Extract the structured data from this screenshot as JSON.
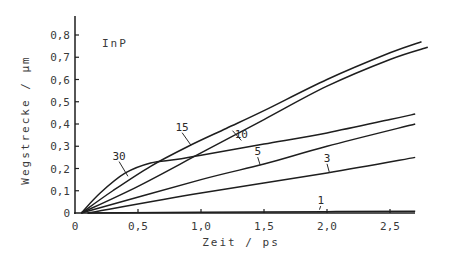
{
  "chart_data": {
    "type": "line",
    "title": "",
    "annotation": "InP",
    "xlabel": "Zeit / ps",
    "ylabel": "Wegstrecke / µm",
    "xlim": [
      0,
      2.7
    ],
    "ylim": [
      0,
      0.85
    ],
    "grid": false,
    "legend": "inline curve labels",
    "x_ticks": [
      {
        "value": 0,
        "label": "0"
      },
      {
        "value": 0.5,
        "label": "0,5"
      },
      {
        "value": 1.0,
        "label": "1,0"
      },
      {
        "value": 1.5,
        "label": "1,5"
      },
      {
        "value": 2.0,
        "label": "2,0"
      },
      {
        "value": 2.5,
        "label": "2,5"
      }
    ],
    "y_ticks": [
      {
        "value": 0,
        "label": "0"
      },
      {
        "value": 0.1,
        "label": "0,1"
      },
      {
        "value": 0.2,
        "label": "0,2"
      },
      {
        "value": 0.3,
        "label": "0,3"
      },
      {
        "value": 0.4,
        "label": "0,4"
      },
      {
        "value": 0.5,
        "label": "0,5"
      },
      {
        "value": 0.6,
        "label": "0,6"
      },
      {
        "value": 0.7,
        "label": "0,7"
      },
      {
        "value": 0.8,
        "label": "0,8"
      }
    ],
    "series": [
      {
        "name": "30",
        "label_pos": [
          0.35,
          0.24
        ],
        "leader_to": [
          0.42,
          0.165
        ],
        "points": [
          [
            0.05,
            0
          ],
          [
            0.2,
            0.09
          ],
          [
            0.4,
            0.18
          ],
          [
            0.6,
            0.225
          ],
          [
            0.8,
            0.24
          ],
          [
            1.0,
            0.26
          ],
          [
            1.5,
            0.31
          ],
          [
            2.0,
            0.36
          ],
          [
            2.5,
            0.42
          ],
          [
            2.7,
            0.445
          ]
        ]
      },
      {
        "name": "15",
        "label_pos": [
          0.85,
          0.37
        ],
        "leader_to": [
          0.92,
          0.305
        ],
        "points": [
          [
            0.05,
            0
          ],
          [
            0.3,
            0.1
          ],
          [
            0.6,
            0.21
          ],
          [
            0.9,
            0.3
          ],
          [
            1.2,
            0.38
          ],
          [
            1.5,
            0.46
          ],
          [
            2.0,
            0.6
          ],
          [
            2.5,
            0.72
          ],
          [
            2.75,
            0.77
          ]
        ]
      },
      {
        "name": "10",
        "label_pos": [
          1.32,
          0.335
        ],
        "leader_to": [
          1.25,
          0.37
        ],
        "points": [
          [
            0.05,
            0
          ],
          [
            0.5,
            0.12
          ],
          [
            1.0,
            0.27
          ],
          [
            1.5,
            0.42
          ],
          [
            2.0,
            0.57
          ],
          [
            2.5,
            0.69
          ],
          [
            2.8,
            0.745
          ]
        ]
      },
      {
        "name": "5",
        "label_pos": [
          1.45,
          0.26
        ],
        "leader_to": [
          1.47,
          0.215
        ],
        "points": [
          [
            0.05,
            0
          ],
          [
            1.0,
            0.15
          ],
          [
            1.5,
            0.22
          ],
          [
            2.0,
            0.3
          ],
          [
            2.7,
            0.4
          ]
        ]
      },
      {
        "name": "3",
        "label_pos": [
          2.0,
          0.23
        ],
        "leader_to": [
          2.02,
          0.18
        ],
        "points": [
          [
            0.1,
            0
          ],
          [
            1.0,
            0.09
          ],
          [
            2.0,
            0.18
          ],
          [
            2.7,
            0.25
          ]
        ]
      },
      {
        "name": "1",
        "label_pos": [
          1.95,
          0.04
        ],
        "leader_to": [
          1.94,
          0.015
        ],
        "points": [
          [
            0.1,
            0
          ],
          [
            1.0,
            0.003
          ],
          [
            2.0,
            0.006
          ],
          [
            2.7,
            0.008
          ]
        ]
      }
    ]
  }
}
